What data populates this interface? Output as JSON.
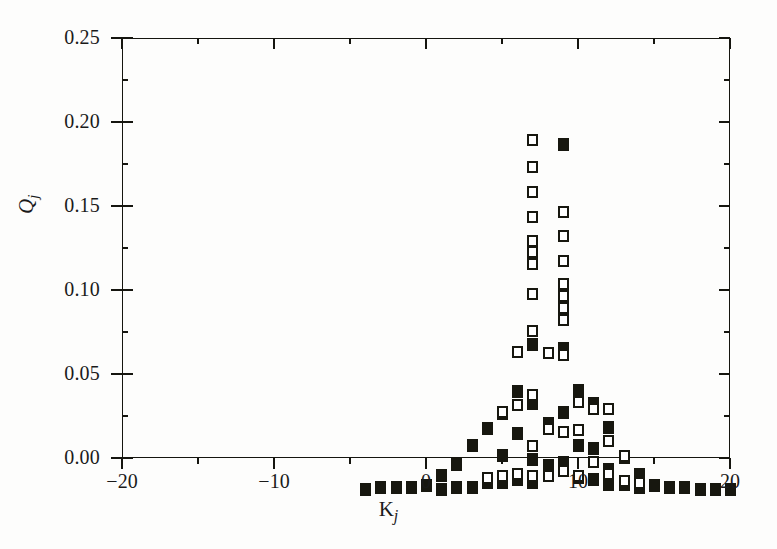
{
  "figure": {
    "background_color": "#fdfdfc",
    "ink_color": "#17170f"
  },
  "axes": {
    "x": {
      "title_main": "K",
      "title_sub": "j",
      "min": -20,
      "max": 20,
      "major_ticks": [
        -20,
        -10,
        0,
        10,
        20
      ],
      "major_tick_labels": [
        "−20",
        "−10",
        "0",
        "10",
        "20"
      ],
      "minor_ticks": [
        -15,
        -5,
        5,
        15
      ]
    },
    "y": {
      "title_main": "Q",
      "title_sub": "j",
      "min": 0.0,
      "max": 0.25,
      "major_ticks": [
        0.0,
        0.05,
        0.1,
        0.15,
        0.2,
        0.25
      ],
      "major_tick_labels": [
        "0.00",
        "0.05",
        "0.10",
        "0.15",
        "0.20",
        "0.25"
      ],
      "minor_ticks": [
        0.025,
        0.075,
        0.125,
        0.175,
        0.225
      ]
    }
  },
  "chart_data": {
    "type": "scatter",
    "title": "",
    "subtitle": "",
    "xlabel": "K_j",
    "ylabel": "Q_j",
    "xlim": [
      -20,
      20
    ],
    "ylim": [
      0.0,
      0.25
    ],
    "grid": false,
    "legend": "none",
    "marker_styles": {
      "filled": "filled black rectangle",
      "open": "open square (white fill, black outline)"
    },
    "series": [
      {
        "name": "filled",
        "marker": "filled",
        "points": [
          {
            "x": -12,
            "y": 0.004
          },
          {
            "x": -11,
            "y": 0.005
          },
          {
            "x": -10,
            "y": 0.005
          },
          {
            "x": -9,
            "y": 0.005
          },
          {
            "x": -8,
            "y": 0.006
          },
          {
            "x": -7,
            "y": 0.012
          },
          {
            "x": -7,
            "y": 0.004
          },
          {
            "x": -6,
            "y": 0.019
          },
          {
            "x": -6,
            "y": 0.005
          },
          {
            "x": -5,
            "y": 0.03
          },
          {
            "x": -5,
            "y": 0.005
          },
          {
            "x": -4,
            "y": 0.04
          },
          {
            "x": -4,
            "y": 0.008
          },
          {
            "x": -3,
            "y": 0.049
          },
          {
            "x": -3,
            "y": 0.024
          },
          {
            "x": -3,
            "y": 0.008
          },
          {
            "x": -2,
            "y": 0.062
          },
          {
            "x": -2,
            "y": 0.037
          },
          {
            "x": -2,
            "y": 0.01
          },
          {
            "x": -1,
            "y": 0.09
          },
          {
            "x": -1,
            "y": 0.055
          },
          {
            "x": -1,
            "y": 0.022
          },
          {
            "x": -1,
            "y": 0.008
          },
          {
            "x": 0,
            "y": 0.043
          },
          {
            "x": 0,
            "y": 0.018
          },
          {
            "x": 1,
            "y": 0.209
          },
          {
            "x": 1,
            "y": 0.088
          },
          {
            "x": 1,
            "y": 0.05
          },
          {
            "x": 1,
            "y": 0.02
          },
          {
            "x": 2,
            "y": 0.063
          },
          {
            "x": 2,
            "y": 0.03
          },
          {
            "x": 2,
            "y": 0.011
          },
          {
            "x": 3,
            "y": 0.055
          },
          {
            "x": 3,
            "y": 0.028
          },
          {
            "x": 3,
            "y": 0.01
          },
          {
            "x": 4,
            "y": 0.041
          },
          {
            "x": 4,
            "y": 0.016
          },
          {
            "x": 4,
            "y": 0.007
          },
          {
            "x": 5,
            "y": 0.023
          },
          {
            "x": 5,
            "y": 0.007
          },
          {
            "x": 6,
            "y": 0.013
          },
          {
            "x": 6,
            "y": 0.005
          },
          {
            "x": 7,
            "y": 0.006
          },
          {
            "x": 8,
            "y": 0.005
          },
          {
            "x": 9,
            "y": 0.005
          },
          {
            "x": 10,
            "y": 0.004
          },
          {
            "x": 11,
            "y": 0.004
          },
          {
            "x": 12,
            "y": 0.004
          }
        ]
      },
      {
        "name": "open",
        "marker": "open",
        "points": [
          {
            "x": -1,
            "y": 0.212
          },
          {
            "x": -1,
            "y": 0.196
          },
          {
            "x": -1,
            "y": 0.181
          },
          {
            "x": -1,
            "y": 0.166
          },
          {
            "x": -1,
            "y": 0.152
          },
          {
            "x": -1,
            "y": 0.145
          },
          {
            "x": -1,
            "y": 0.138
          },
          {
            "x": -1,
            "y": 0.12
          },
          {
            "x": -1,
            "y": 0.098
          },
          {
            "x": -1,
            "y": 0.06
          },
          {
            "x": -1,
            "y": 0.03
          },
          {
            "x": -1,
            "y": 0.012
          },
          {
            "x": 0,
            "y": 0.085
          },
          {
            "x": 0,
            "y": 0.04
          },
          {
            "x": 0,
            "y": 0.012
          },
          {
            "x": 1,
            "y": 0.169
          },
          {
            "x": 1,
            "y": 0.155
          },
          {
            "x": 1,
            "y": 0.14
          },
          {
            "x": 1,
            "y": 0.126
          },
          {
            "x": 1,
            "y": 0.119
          },
          {
            "x": 1,
            "y": 0.112
          },
          {
            "x": 1,
            "y": 0.105
          },
          {
            "x": 1,
            "y": 0.084
          },
          {
            "x": 1,
            "y": 0.038
          },
          {
            "x": 1,
            "y": 0.015
          },
          {
            "x": 2,
            "y": 0.056
          },
          {
            "x": 2,
            "y": 0.039
          },
          {
            "x": 2,
            "y": 0.012
          },
          {
            "x": 3,
            "y": 0.052
          },
          {
            "x": 3,
            "y": 0.02
          },
          {
            "x": 4,
            "y": 0.052
          },
          {
            "x": 4,
            "y": 0.033
          },
          {
            "x": 4,
            "y": 0.013
          },
          {
            "x": 5,
            "y": 0.024
          },
          {
            "x": 5,
            "y": 0.009
          },
          {
            "x": -2,
            "y": 0.086
          },
          {
            "x": -2,
            "y": 0.054
          },
          {
            "x": -2,
            "y": 0.013
          },
          {
            "x": -3,
            "y": 0.05
          },
          {
            "x": -3,
            "y": 0.012
          },
          {
            "x": -4,
            "y": 0.011
          },
          {
            "x": 6,
            "y": 0.008
          }
        ]
      }
    ]
  }
}
